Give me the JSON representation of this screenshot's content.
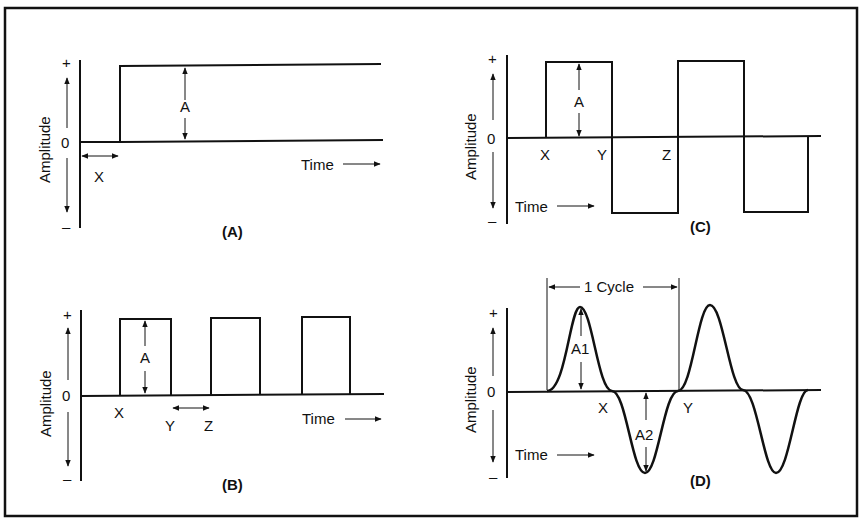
{
  "figure": {
    "panels": [
      {
        "id": "A",
        "caption": "(A)",
        "axis": {
          "ylabel": "Amplitude",
          "plus": "+",
          "zero": "0",
          "minus": "–",
          "xlabel": "Time"
        },
        "markers": {
          "delay": "X",
          "amplitude": "A"
        },
        "waveform": "step"
      },
      {
        "id": "B",
        "caption": "(B)",
        "axis": {
          "ylabel": "Amplitude",
          "plus": "+",
          "zero": "0",
          "minus": "–",
          "xlabel": "Time"
        },
        "markers": {
          "start": "X",
          "end": "Y",
          "next": "Z",
          "amplitude": "A"
        },
        "waveform": "pulse-train"
      },
      {
        "id": "C",
        "caption": "(C)",
        "axis": {
          "ylabel": "Amplitude",
          "plus": "+",
          "zero": "0",
          "minus": "–",
          "xlabel": "Time"
        },
        "markers": {
          "start": "X",
          "mid": "Y",
          "end": "Z",
          "amplitude": "A"
        },
        "waveform": "square-wave"
      },
      {
        "id": "D",
        "caption": "(D)",
        "axis": {
          "ylabel": "Amplitude",
          "plus": "+",
          "zero": "0",
          "minus": "–",
          "xlabel": "Time"
        },
        "markers": {
          "half": "X",
          "full": "Y",
          "peak_pos": "A1",
          "peak_neg": "A2",
          "cycle": "1 Cycle"
        },
        "waveform": "sine-wave"
      }
    ]
  }
}
